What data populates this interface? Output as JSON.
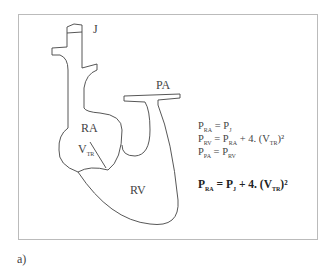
{
  "diagram": {
    "labels": {
      "j": "J",
      "pa": "PA",
      "ra": "RA",
      "vtr": "V",
      "vtr_sub": "TR",
      "rv": "RV"
    },
    "equations": [
      {
        "lhs": "P",
        "lhs_sub": "RA",
        "rhs": "= P",
        "rhs_sub": "J",
        "tail": "",
        "tail_sub": "",
        "end": ""
      },
      {
        "lhs": "P",
        "lhs_sub": "RV",
        "rhs": "= P",
        "rhs_sub": "RA",
        "tail": " + 4. (V",
        "tail_sub": "TR",
        "end": ")²"
      },
      {
        "lhs": "P",
        "lhs_sub": "PA",
        "rhs": "= P",
        "rhs_sub": "RV",
        "tail": "",
        "tail_sub": "",
        "end": ""
      }
    ],
    "result": {
      "lhs": "P",
      "lhs_sub": "RA",
      "rhs": "= P",
      "rhs_sub": "J",
      "tail": " + 4. (V",
      "tail_sub": "TR",
      "end": ")²"
    },
    "caption": "a)",
    "marker": "b"
  }
}
